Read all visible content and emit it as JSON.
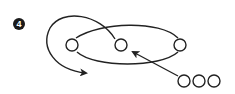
{
  "step_badge": {
    "label": "4",
    "fill": "#1a1a1a",
    "text_color": "#ffffff"
  },
  "colors": {
    "stroke": "#222222",
    "background": "#ffffff"
  },
  "diagram": {
    "ring_nodes": [
      {
        "id": "left",
        "cx": 72,
        "cy": 45
      },
      {
        "id": "middle",
        "cx": 121,
        "cy": 45
      },
      {
        "id": "right",
        "cx": 180,
        "cy": 45
      }
    ],
    "queue_nodes": [
      {
        "id": "q1",
        "cx": 184,
        "cy": 81
      },
      {
        "id": "q2",
        "cx": 199,
        "cy": 81
      },
      {
        "id": "q3",
        "cx": 214,
        "cy": 81
      }
    ],
    "node_radius": 6
  }
}
